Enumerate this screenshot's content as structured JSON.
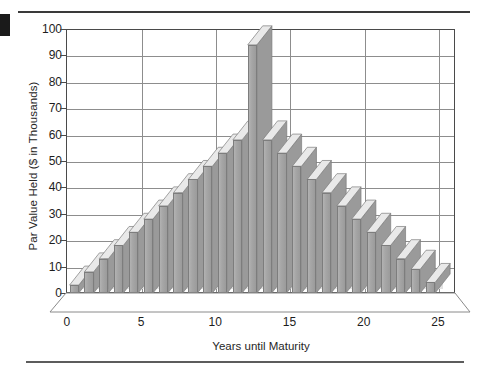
{
  "figure": {
    "title": "",
    "ylabel": "Par Value Held ($ in Thousands)",
    "xlabel": "Years until Maturity"
  },
  "axes": {
    "y_ticks": [
      "0",
      "10",
      "20",
      "30",
      "40",
      "50",
      "60",
      "70",
      "80",
      "90",
      "100"
    ],
    "x_ticks": [
      "0",
      "5",
      "10",
      "15",
      "20",
      "25"
    ]
  },
  "colors": {
    "bar_front": "#a6a6a6",
    "bar_top": "#e9e9e9",
    "bar_side": "#9a9a9a",
    "shadow": "#e2e2e2",
    "grid": "#8d8d8d",
    "frame": "#4a4a4a",
    "text": "#1d1d1d",
    "rule": "#3a3a3a"
  },
  "chart_data": {
    "type": "bar",
    "title": "",
    "xlabel": "Years until Maturity",
    "ylabel": "Par Value Held ($ in Thousands)",
    "xlim": [
      0,
      26
    ],
    "ylim": [
      0,
      100
    ],
    "ytick_values": [
      0,
      10,
      20,
      30,
      40,
      50,
      60,
      70,
      80,
      90,
      100
    ],
    "xtick_values": [
      0,
      5,
      10,
      15,
      20,
      25
    ],
    "grid": true,
    "legend": false,
    "three_d": true,
    "units": "$ thousands",
    "categories": [
      1,
      2,
      3,
      4,
      5,
      6,
      7,
      8,
      9,
      10,
      11,
      12,
      13,
      14,
      15,
      16,
      17,
      18,
      19,
      20,
      21,
      22,
      23,
      24,
      25
    ],
    "values": [
      3,
      8,
      13,
      18,
      23,
      28,
      33,
      38,
      43,
      48,
      53,
      58,
      94,
      58,
      53,
      48,
      43,
      38,
      33,
      28,
      23,
      18,
      13,
      9,
      4
    ]
  }
}
